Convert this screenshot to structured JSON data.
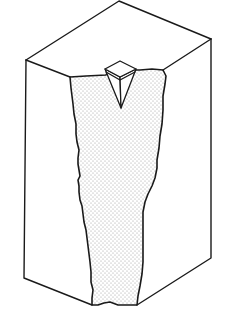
{
  "figure": {
    "colors": {
      "line": "#1a1a1a",
      "background": "#ffffff",
      "stipple": "#9a9a9a"
    },
    "block": {
      "top_back": [
        119,
        1
      ],
      "top_left": [
        26,
        60
      ],
      "top_right": [
        211,
        39
      ],
      "bottom_left": [
        24,
        278
      ],
      "bottom_right": [
        211,
        258
      ],
      "front_bottom_left": [
        92,
        305
      ],
      "front_bottom_right": [
        137,
        305
      ]
    },
    "indenter": {
      "top_face": [
        [
          105,
          69
        ],
        [
          120,
          61
        ],
        [
          136,
          69
        ],
        [
          120,
          77
        ]
      ],
      "tip": [
        121,
        108
      ]
    }
  }
}
